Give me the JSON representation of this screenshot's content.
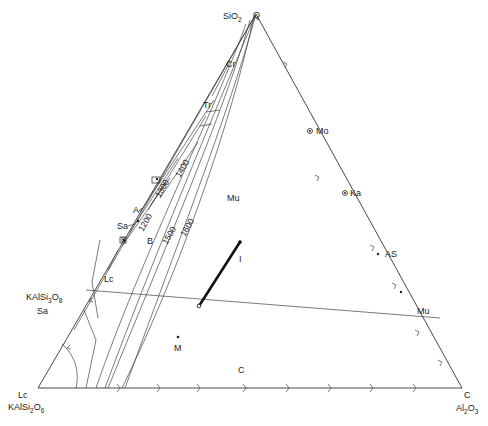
{
  "diagram": {
    "vertices": {
      "top": {
        "formula_main": "SiO",
        "formula_sub": "2",
        "mineral": "Q"
      },
      "bottom_left": {
        "mineral": "Lc",
        "formula_main": "KAlSi",
        "formula_sub1": "2",
        "formula_o": "O",
        "formula_sub2": "6"
      },
      "bottom_right": {
        "mineral": "C",
        "formula_main": "Al",
        "formula_sub1": "2",
        "formula_o": "O",
        "formula_sub2": "3"
      }
    },
    "side_labels": {
      "kalsi3o8": {
        "main": "KAlSi",
        "sub1": "3",
        "o": "O",
        "sub2": "8"
      },
      "sa_left": "Sa"
    },
    "field_labels": {
      "cr": "Cr",
      "tr": "Tr",
      "mu_field": "Mu",
      "c_field": "C",
      "lc_field": "Lc",
      "sa_field": "Sa",
      "m_point": "M",
      "i_line": "I"
    },
    "points": {
      "mo": "Mo",
      "ka": "Ka",
      "as": "AS",
      "mu": "Mu",
      "a": "A",
      "b": "B",
      "b_boxed": "B",
      "a_boxed": "A"
    },
    "isotherms": [
      "1200",
      "1300",
      "1400",
      "1500",
      "1600"
    ],
    "colors": {
      "ink": "#222222",
      "background": "#ffffff"
    }
  }
}
